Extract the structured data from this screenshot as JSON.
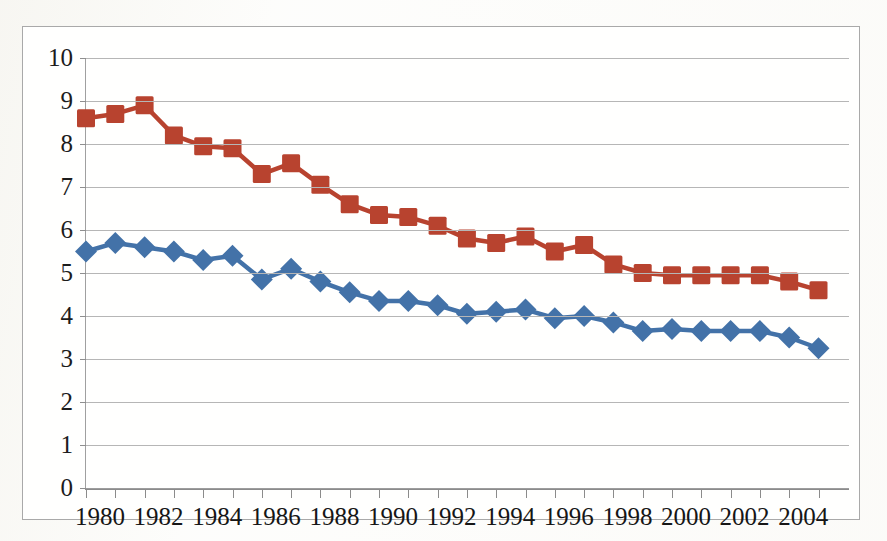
{
  "chart_data": {
    "type": "line",
    "title": "",
    "subtitle": "",
    "xlabel": "",
    "ylabel": "",
    "xlim": [
      1980,
      2005
    ],
    "ylim": [
      0,
      10
    ],
    "y_ticks": [
      0,
      1,
      2,
      3,
      4,
      5,
      6,
      7,
      8,
      9,
      10
    ],
    "y_tick_labels": [
      "0",
      "1",
      "2",
      "3",
      "4",
      "5",
      "6",
      "7",
      "8",
      "9",
      "10"
    ],
    "x": [
      1980,
      1981,
      1982,
      1983,
      1984,
      1985,
      1986,
      1987,
      1988,
      1989,
      1990,
      1991,
      1992,
      1993,
      1994,
      1995,
      1996,
      1997,
      1998,
      1999,
      2000,
      2001,
      2002,
      2003,
      2004,
      2005
    ],
    "x_tick_labels": [
      "1980",
      "",
      "1982",
      "",
      "1984",
      "",
      "1986",
      "",
      "1988",
      "",
      "1990",
      "",
      "1992",
      "",
      "1994",
      "",
      "1996",
      "",
      "1998",
      "",
      "2000",
      "",
      "2002",
      "",
      "2004",
      ""
    ],
    "x_labeled_years": [
      "1980",
      "1982",
      "1984",
      "1986",
      "1988",
      "1990",
      "1992",
      "1994",
      "1996",
      "1998",
      "2000",
      "2002",
      "2004"
    ],
    "grid": "horizontal",
    "legend": "none",
    "series": [
      {
        "name": "Series 1",
        "marker": "diamond",
        "color": "#4372a8",
        "values": [
          5.5,
          5.7,
          5.6,
          5.5,
          5.3,
          5.4,
          4.85,
          5.1,
          4.8,
          4.55,
          4.35,
          4.35,
          4.25,
          4.05,
          4.1,
          4.15,
          3.95,
          4.0,
          3.85,
          3.65,
          3.7,
          3.65,
          3.65,
          3.65,
          3.5,
          3.25
        ]
      },
      {
        "name": "Series 2",
        "marker": "square",
        "color": "#b8432f",
        "values": [
          8.6,
          8.7,
          8.9,
          8.2,
          7.95,
          7.9,
          7.3,
          7.55,
          7.05,
          6.6,
          6.35,
          6.3,
          6.1,
          5.8,
          5.7,
          5.85,
          5.5,
          5.65,
          5.2,
          5.0,
          4.95,
          4.95,
          4.95,
          4.95,
          4.8,
          4.6
        ]
      }
    ]
  },
  "figure": {
    "background_color": "#fdfdfb",
    "plot_background_color": "#ffffff",
    "border_color": "#a9a9a9",
    "gridline_color": "#b6b6b6",
    "axis_color": "#8b8b8b",
    "tick_label_color": "#1c1c1c"
  }
}
